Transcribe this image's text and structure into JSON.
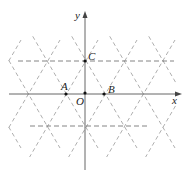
{
  "diagram": {
    "type": "coordinate-plane-triangular-lattice",
    "axes": {
      "x_label": "x",
      "y_label": "y"
    },
    "points": [
      {
        "name": "O",
        "label": "O",
        "px": [
          85,
          94
        ]
      },
      {
        "name": "A",
        "label": "A",
        "px": [
          66,
          94
        ]
      },
      {
        "name": "B",
        "label": "B",
        "px": [
          104,
          94
        ]
      },
      {
        "name": "C",
        "label": "C",
        "px": [
          85,
          61
        ]
      }
    ],
    "lattice_nodes": [
      [
        27,
        94
      ],
      [
        66,
        94
      ],
      [
        104,
        94
      ],
      [
        143,
        94
      ],
      [
        46,
        61
      ],
      [
        85,
        61
      ],
      [
        123,
        61
      ],
      [
        46,
        126
      ],
      [
        85,
        126
      ],
      [
        123,
        126
      ]
    ],
    "colors": {
      "axis": "#555555",
      "grid": "#9a9a9a",
      "text": "#222222"
    }
  },
  "labels": {
    "x": "x",
    "y": "y",
    "O": "O",
    "A": "A",
    "B": "B",
    "C": "C"
  }
}
